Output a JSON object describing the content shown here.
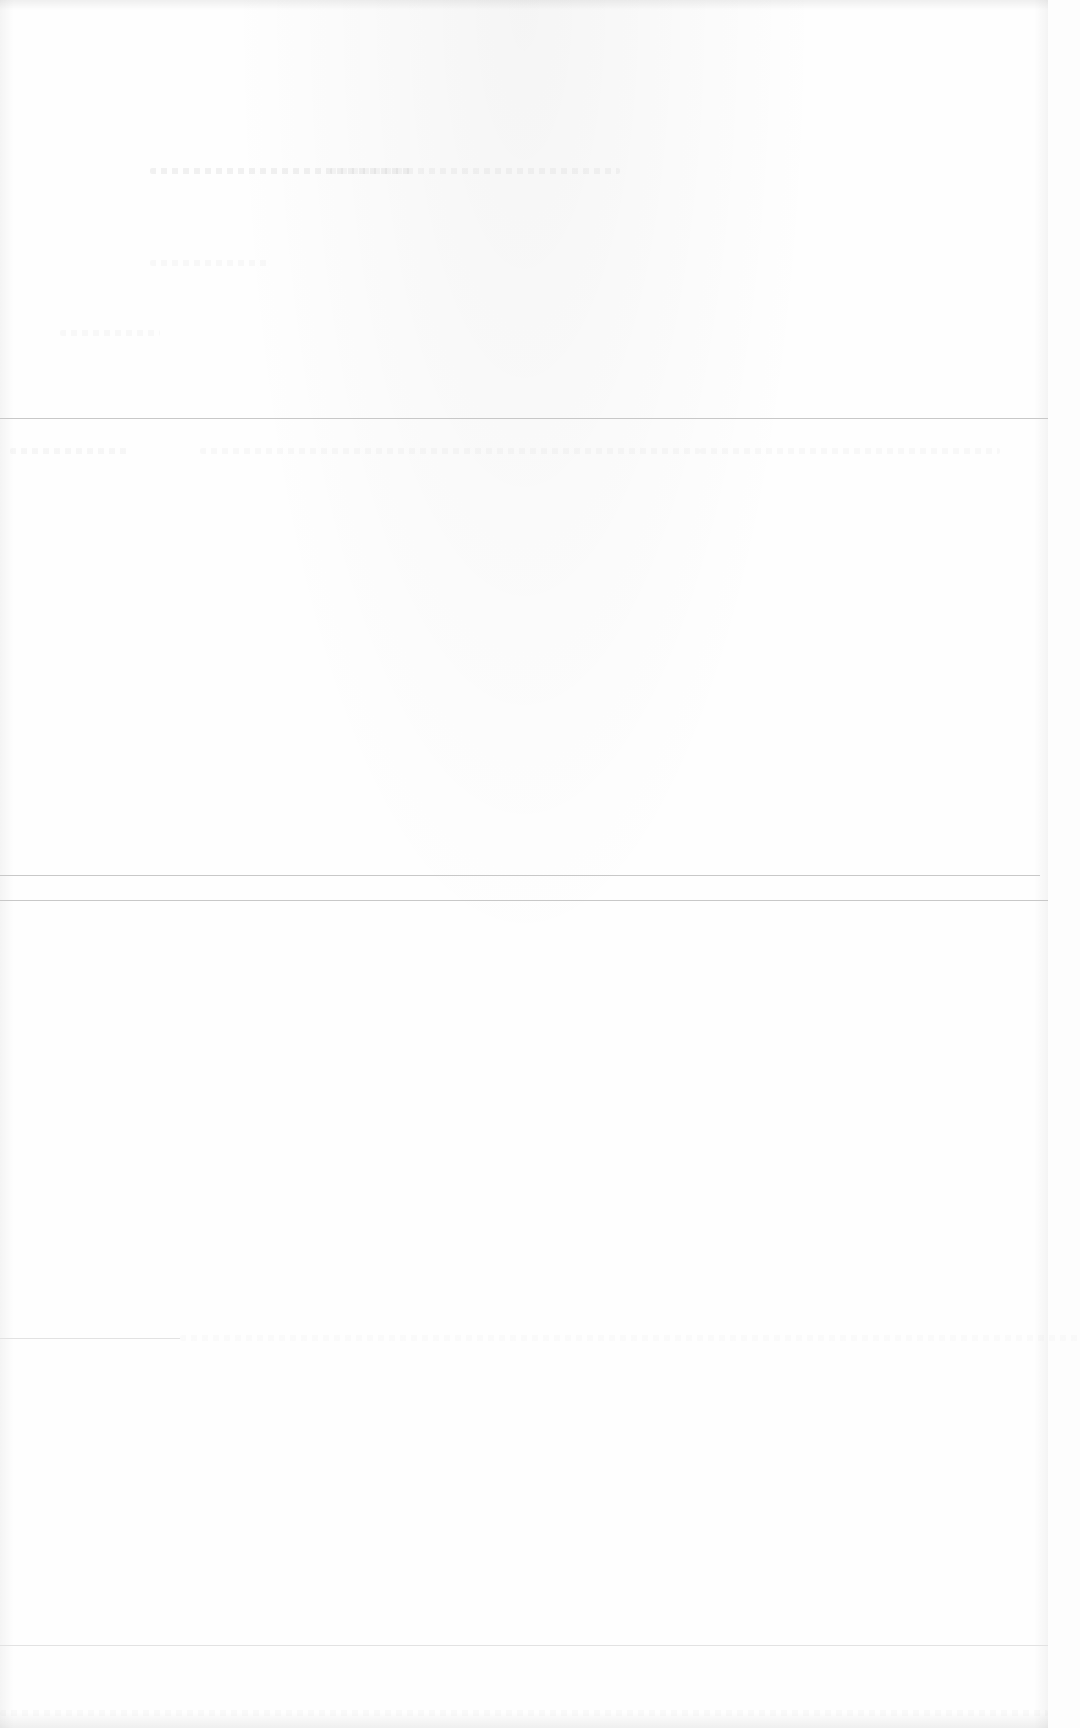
{
  "page": {
    "background": "#fefefe",
    "rule_color": "#c8c8c8",
    "legible_text": []
  },
  "rules": [
    {
      "y": 418,
      "width": 1048
    },
    {
      "y": 875,
      "width": 1040
    },
    {
      "y": 900,
      "width": 1048
    },
    {
      "y": 1338,
      "width": 180
    },
    {
      "y": 1645,
      "width": 1048
    }
  ]
}
